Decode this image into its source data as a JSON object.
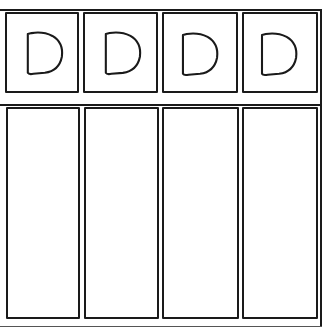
{
  "diagram": {
    "top_row": {
      "cells": [
        {
          "label": "D",
          "icon": "letter-d-icon"
        },
        {
          "label": "D",
          "icon": "letter-d-icon"
        },
        {
          "label": "D",
          "icon": "letter-d-icon"
        },
        {
          "label": "D",
          "icon": "letter-d-icon"
        }
      ]
    },
    "bottom_row": {
      "columns": [
        {
          "label": ""
        },
        {
          "label": ""
        },
        {
          "label": ""
        },
        {
          "label": ""
        }
      ]
    },
    "colors": {
      "line": "#1a1a1a",
      "background": "#ffffff"
    }
  }
}
